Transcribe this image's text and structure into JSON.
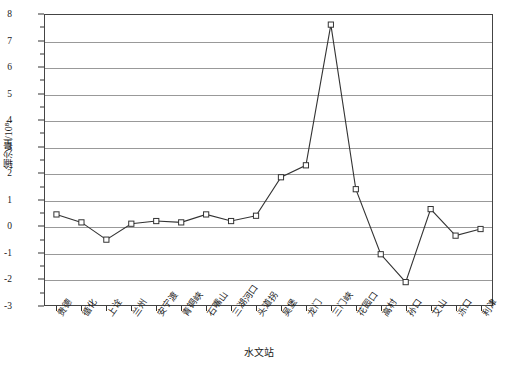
{
  "chart_data": {
    "type": "line",
    "title": "",
    "xlabel": "水文站",
    "ylabel": "输沙量/10⁸t",
    "ylim": [
      -3,
      8
    ],
    "yticks": [
      -3,
      -2,
      -1,
      0,
      1,
      2,
      3,
      4,
      5,
      6,
      7,
      8
    ],
    "ytick_labels": [
      "-3",
      "-2",
      "-1",
      "0",
      "1",
      "2",
      "3",
      "4",
      "5",
      "6",
      "7",
      "8"
    ],
    "grid": true,
    "legend": "none",
    "categories": [
      "贵德",
      "循化",
      "上诠",
      "兰州",
      "安宁渡",
      "青铜峡",
      "石嘴山",
      "三湖河口",
      "头道拐",
      "吴堡",
      "龙门",
      "三门峡",
      "花园口",
      "高村",
      "孙口",
      "艾山",
      "泺口",
      "利津"
    ],
    "values": [
      0.45,
      0.15,
      -0.5,
      0.1,
      0.2,
      0.15,
      0.45,
      0.2,
      0.4,
      1.85,
      2.3,
      7.6,
      1.4,
      -1.05,
      -2.1,
      0.65,
      -0.35,
      -0.1
    ],
    "series": [
      {
        "name": "输沙量",
        "values": [
          0.45,
          0.15,
          -0.5,
          0.1,
          0.2,
          0.15,
          0.45,
          0.2,
          0.4,
          1.85,
          2.3,
          7.6,
          1.4,
          -1.05,
          -2.1,
          0.65,
          -0.35,
          -0.1
        ]
      }
    ],
    "marker": "square-open",
    "line_color": "#333333",
    "marker_fill": "#ffffff"
  }
}
